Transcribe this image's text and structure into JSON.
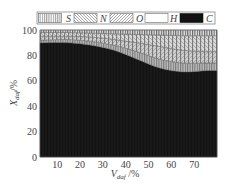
{
  "chart_data": {
    "type": "area",
    "stacked": true,
    "title": "",
    "xlabel": "V_daf /%",
    "ylabel": "X_daf /%",
    "xlim": [
      2.5,
      80
    ],
    "ylim": [
      0,
      100
    ],
    "xticks": [
      10,
      20,
      30,
      40,
      50,
      60,
      70
    ],
    "yticks": [
      0,
      20,
      40,
      60,
      80,
      100
    ],
    "grid": false,
    "legend_position": "top",
    "x": [
      2.5,
      15,
      25,
      35,
      45,
      55,
      65,
      75,
      80
    ],
    "series": [
      {
        "name": "C",
        "pattern": "solid-black",
        "values": [
          90,
          90,
          88,
          84,
          77,
          70,
          67,
          68,
          68
        ]
      },
      {
        "name": "H",
        "pattern": "white",
        "values": [
          2,
          2.5,
          3,
          4,
          6,
          7,
          7,
          6,
          6
        ]
      },
      {
        "name": "O",
        "pattern": "forward-diagonal-hatch",
        "values": [
          3,
          2.5,
          3.5,
          4.5,
          7,
          10,
          10,
          9,
          9
        ]
      },
      {
        "name": "N",
        "pattern": "back-diagonal-hatch",
        "values": [
          3,
          3,
          3,
          4.5,
          6.5,
          9,
          11.5,
          12.5,
          12.5
        ]
      },
      {
        "name": "S",
        "pattern": "vertical-lines",
        "values": [
          2,
          2,
          2.5,
          3,
          3.5,
          4,
          4.5,
          4.5,
          4.5
        ]
      }
    ]
  },
  "legend": {
    "items": [
      {
        "label": "S"
      },
      {
        "label": "N"
      },
      {
        "label": "O"
      },
      {
        "label": "H"
      },
      {
        "label": "C"
      }
    ]
  },
  "axes": {
    "x_label_main": "V",
    "x_label_sub": "daf",
    "x_label_unit": " /%",
    "y_label_main": "X",
    "y_label_sub": "daf",
    "y_label_unit": "/%",
    "x_tick_labels": [
      "10",
      "20",
      "30",
      "40",
      "50",
      "60",
      "70"
    ],
    "y_tick_labels": [
      "0",
      "20",
      "40",
      "60",
      "80",
      "100"
    ]
  }
}
